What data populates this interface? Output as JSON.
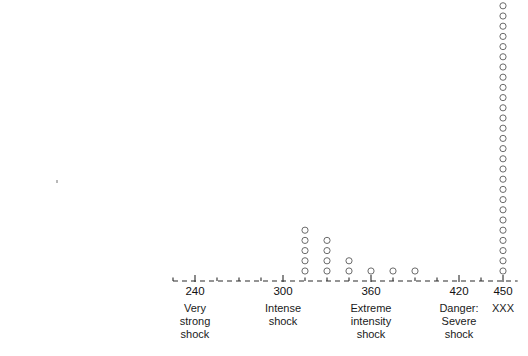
{
  "chart_data": {
    "type": "scatter",
    "title": "",
    "xlabel": "",
    "ylabel": "",
    "grid": false,
    "legend": null,
    "axis_break": true,
    "axis_segments": [
      {
        "from": 0,
        "to": 75
      },
      {
        "from": 225,
        "to": 460
      }
    ],
    "x_ticks": [
      0,
      60,
      240,
      300,
      360,
      420,
      450
    ],
    "x_tick_labels": [
      "0",
      "60",
      "240",
      "300",
      "360",
      "420",
      "450"
    ],
    "x_minor_tick_step": 15,
    "category_labels": [
      {
        "at": 60,
        "lines": [
          "Slight",
          "shock"
        ]
      },
      {
        "at": 240,
        "lines": [
          "Very",
          "strong",
          "shock"
        ]
      },
      {
        "at": 300,
        "lines": [
          "Intense",
          "shock"
        ]
      },
      {
        "at": 360,
        "lines": [
          "Extreme",
          "intensity",
          "shock"
        ]
      },
      {
        "at": 420,
        "lines": [
          "Danger:",
          "Severe",
          "shock"
        ]
      },
      {
        "at": 450,
        "lines": [
          "XXX"
        ]
      }
    ],
    "marker": "open-circle",
    "stacks": [
      {
        "x": 315,
        "count": 5
      },
      {
        "x": 330,
        "count": 4
      },
      {
        "x": 345,
        "count": 2
      },
      {
        "x": 360,
        "count": 1
      },
      {
        "x": 375,
        "count": 1
      },
      {
        "x": 390,
        "count": 1
      },
      {
        "x": 450,
        "count": 27
      }
    ],
    "total_observations": 41,
    "artifacts": [
      {
        "x_px": 56,
        "y_px": 180,
        "kind": "speck"
      }
    ]
  },
  "plot": {
    "px_per_unit": 1.4667,
    "baseline_y": 271,
    "dot_spacing_y": 10.2,
    "dot_radius": 3.1,
    "axis_y": 281,
    "left_origin_px": 17,
    "right_origin_px": 283,
    "right_origin_value": 300
  }
}
